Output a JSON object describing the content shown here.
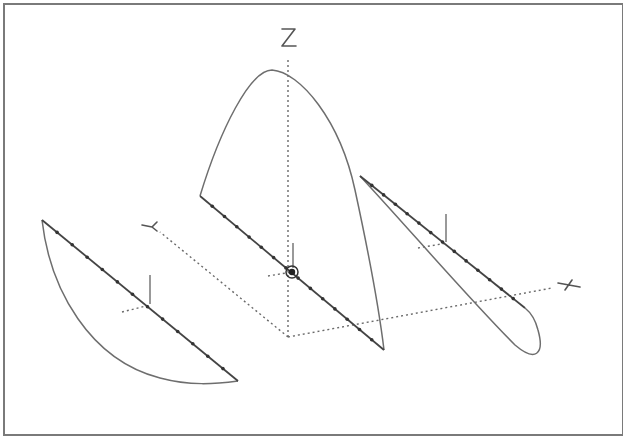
{
  "diagram": {
    "axes": {
      "x_label": "X",
      "y_label": "Y",
      "z_label": "Z"
    },
    "shapes": [
      {
        "name": "left-profile",
        "description": "curved segment lying in X-Y plane (left)",
        "marker_count": 12
      },
      {
        "name": "center-profile",
        "description": "parabolic arch rising along Z axis",
        "marker_count": 14
      },
      {
        "name": "right-profile",
        "description": "narrow loop on the right",
        "marker_count": 13
      }
    ],
    "origin_marker": "target-icon"
  }
}
